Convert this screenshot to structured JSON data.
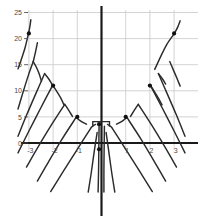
{
  "chart_data": {
    "type": "line",
    "title": "",
    "subtitle": "",
    "xlabel": "",
    "ylabel": "",
    "xlim": [
      -3.45,
      3.45
    ],
    "ylim": [
      -9.5,
      26.5
    ],
    "grid": true,
    "legend": false,
    "legend_position": "none",
    "colors": {
      "axis": "#1a1a1a",
      "grid": "#c8c8c8",
      "curve": "#2b2b2b",
      "marker": "#111111",
      "label": "#4a4a4a",
      "background": "#ffffff"
    },
    "x_ticks": [
      {
        "value": -3,
        "label": "-3"
      },
      {
        "value": -2,
        "label": "-2"
      },
      {
        "value": -1,
        "label": "-1"
      },
      {
        "value": 1,
        "label": "1"
      },
      {
        "value": 2,
        "label": "2"
      },
      {
        "value": 3,
        "label": "3"
      }
    ],
    "y_ticks": [
      {
        "value": 0,
        "label": "0"
      },
      {
        "value": 5,
        "label": "5"
      },
      {
        "value": 10,
        "label": "10"
      },
      {
        "value": 15,
        "label": "15"
      },
      {
        "value": 20,
        "label": "20"
      },
      {
        "value": 25,
        "label": "25"
      }
    ],
    "markers": [
      {
        "x": -3.0,
        "y": 21.0,
        "label": ""
      },
      {
        "x": -2.0,
        "y": 11.0,
        "label": ""
      },
      {
        "x": -1.0,
        "y": 5.0,
        "label": ""
      },
      {
        "x": -0.1,
        "y": 3.6,
        "label": ""
      },
      {
        "x": 1.0,
        "y": 5.0,
        "label": ""
      },
      {
        "x": 2.0,
        "y": 11.0,
        "label": ""
      },
      {
        "x": 3.0,
        "y": 21.0,
        "label": ""
      },
      {
        "x": -0.1,
        "y": -1.2,
        "label": ""
      }
    ],
    "series": [
      {
        "name": "upper-left-outer",
        "points": [
          [
            -3.45,
            14.2
          ],
          [
            -3.3,
            16.2
          ],
          [
            -3.15,
            18.4
          ],
          [
            -3.02,
            20.9
          ]
        ]
      },
      {
        "name": "upper-left-outer-tail",
        "points": [
          [
            -3.02,
            20.9
          ],
          [
            -2.96,
            22.3
          ],
          [
            -2.92,
            23.6
          ]
        ]
      },
      {
        "name": "upper-left-mid-rise",
        "points": [
          [
            -3.45,
            6.5
          ],
          [
            -3.25,
            9.6
          ],
          [
            -3.02,
            13.0
          ],
          [
            -2.82,
            15.6
          ]
        ]
      },
      {
        "name": "upper-left-mid-fall",
        "points": [
          [
            -2.82,
            15.6
          ],
          [
            -2.72,
            17.6
          ],
          [
            -2.65,
            19.2
          ]
        ]
      },
      {
        "name": "upper-left-mid-down",
        "points": [
          [
            -2.82,
            15.6
          ],
          [
            -2.7,
            14.6
          ],
          [
            -2.58,
            13.3
          ],
          [
            -2.48,
            11.8
          ]
        ]
      },
      {
        "name": "peak-a-rise",
        "points": [
          [
            -3.45,
            1.3
          ],
          [
            -3.1,
            5.3
          ],
          [
            -2.7,
            9.6
          ],
          [
            -2.35,
            13.3
          ]
        ]
      },
      {
        "name": "peak-a-fall",
        "points": [
          [
            -2.35,
            13.3
          ],
          [
            -2.2,
            12.4
          ],
          [
            -2.05,
            11.3
          ]
        ]
      },
      {
        "name": "peak-b-rise",
        "points": [
          [
            -3.45,
            -1.9
          ],
          [
            -3.0,
            2.3
          ],
          [
            -2.5,
            6.8
          ],
          [
            -2.02,
            11.05
          ]
        ]
      },
      {
        "name": "peak-b-fall",
        "points": [
          [
            -2.02,
            11.05
          ],
          [
            -1.85,
            9.9
          ],
          [
            -1.68,
            8.6
          ],
          [
            -1.55,
            7.3
          ]
        ]
      },
      {
        "name": "peak-c-rise",
        "points": [
          [
            -3.1,
            -4.6
          ],
          [
            -2.6,
            -0.6
          ],
          [
            -2.05,
            3.6
          ],
          [
            -1.52,
            7.4
          ]
        ]
      },
      {
        "name": "peak-c-fall",
        "points": [
          [
            -1.52,
            7.4
          ],
          [
            -1.4,
            6.6
          ],
          [
            -1.28,
            5.7
          ],
          [
            -1.2,
            5.1
          ]
        ]
      },
      {
        "name": "peak-d-rise",
        "points": [
          [
            -2.65,
            -7.3
          ],
          [
            -2.2,
            -3.7
          ],
          [
            -1.65,
            0.6
          ],
          [
            -1.05,
            4.9
          ]
        ]
      },
      {
        "name": "peak-d-fall",
        "points": [
          [
            -1.05,
            4.9
          ],
          [
            -0.9,
            4.35
          ],
          [
            -0.75,
            3.9
          ],
          [
            -0.62,
            3.6
          ]
        ]
      },
      {
        "name": "left-inner-rise",
        "points": [
          [
            -2.1,
            -9.3
          ],
          [
            -1.6,
            -5.6
          ],
          [
            -1.0,
            -1.2
          ],
          [
            -0.42,
            3.0
          ]
        ]
      },
      {
        "name": "left-inner-near-axis",
        "points": [
          [
            -0.42,
            3.0
          ],
          [
            -0.33,
            3.35
          ],
          [
            -0.25,
            3.55
          ]
        ]
      },
      {
        "name": "left-steep-tail",
        "points": [
          [
            -0.55,
            -9.4
          ],
          [
            -0.42,
            -5.6
          ],
          [
            -0.3,
            -1.6
          ],
          [
            -0.18,
            2.0
          ]
        ]
      },
      {
        "name": "center-left-vertical",
        "points": [
          [
            -0.14,
            -9.4
          ],
          [
            -0.12,
            -5.0
          ],
          [
            -0.11,
            -0.6
          ],
          [
            -0.1,
            3.2
          ]
        ]
      },
      {
        "name": "center-right-vertical",
        "points": [
          [
            0.1,
            -9.4
          ],
          [
            0.1,
            -5.0
          ],
          [
            0.11,
            -0.6
          ],
          [
            0.12,
            3.2
          ]
        ]
      },
      {
        "name": "right-steep-tail",
        "points": [
          [
            0.55,
            -9.4
          ],
          [
            0.42,
            -5.6
          ],
          [
            0.3,
            -1.6
          ],
          [
            0.19,
            2.0
          ]
        ]
      },
      {
        "name": "right-inner-rise",
        "points": [
          [
            2.1,
            -9.3
          ],
          [
            1.6,
            -5.6
          ],
          [
            1.0,
            -1.2
          ],
          [
            0.42,
            3.0
          ]
        ]
      },
      {
        "name": "right-inner-near-axis",
        "points": [
          [
            0.42,
            3.0
          ],
          [
            0.33,
            3.35
          ],
          [
            0.25,
            3.55
          ]
        ]
      },
      {
        "name": "peak-d-rise-r",
        "points": [
          [
            2.65,
            -7.3
          ],
          [
            2.2,
            -3.7
          ],
          [
            1.65,
            0.6
          ],
          [
            1.05,
            4.9
          ]
        ]
      },
      {
        "name": "peak-d-fall-r",
        "points": [
          [
            1.05,
            4.9
          ],
          [
            0.9,
            4.35
          ],
          [
            0.75,
            3.9
          ],
          [
            0.62,
            3.6
          ]
        ]
      },
      {
        "name": "peak-c-rise-r",
        "points": [
          [
            3.1,
            -4.6
          ],
          [
            2.6,
            -0.6
          ],
          [
            2.05,
            3.6
          ],
          [
            1.52,
            7.4
          ]
        ]
      },
      {
        "name": "peak-c-fall-r",
        "points": [
          [
            1.52,
            7.4
          ],
          [
            1.4,
            6.6
          ],
          [
            1.28,
            5.7
          ],
          [
            1.2,
            5.1
          ]
        ]
      },
      {
        "name": "peak-b-rise-r",
        "points": [
          [
            3.45,
            -1.9
          ],
          [
            3.0,
            2.3
          ],
          [
            2.5,
            6.8
          ],
          [
            2.02,
            11.05
          ]
        ]
      },
      {
        "name": "peak-b-fall-r",
        "points": [
          [
            2.02,
            11.05
          ],
          [
            2.18,
            9.9
          ],
          [
            2.35,
            8.6
          ],
          [
            2.5,
            7.3
          ]
        ]
      },
      {
        "name": "peak-a-rise-r",
        "points": [
          [
            3.45,
            1.3
          ],
          [
            3.1,
            5.3
          ],
          [
            2.7,
            9.6
          ],
          [
            2.35,
            13.3
          ]
        ]
      },
      {
        "name": "peak-a-fall-r",
        "points": [
          [
            2.35,
            13.3
          ],
          [
            2.5,
            12.4
          ],
          [
            2.65,
            11.3
          ]
        ]
      },
      {
        "name": "upper-right-mid-rise",
        "points": [
          [
            2.2,
            14.1
          ],
          [
            2.45,
            16.6
          ],
          [
            2.7,
            18.9
          ],
          [
            3.0,
            20.9
          ]
        ]
      },
      {
        "name": "upper-right-mid-fall",
        "points": [
          [
            2.82,
            15.6
          ],
          [
            2.95,
            14.2
          ],
          [
            3.1,
            12.6
          ],
          [
            3.25,
            10.9
          ]
        ]
      },
      {
        "name": "upper-right-outer",
        "points": [
          [
            3.0,
            20.9
          ],
          [
            3.15,
            22.2
          ],
          [
            3.25,
            23.4
          ]
        ]
      }
    ],
    "origin_bracket": {
      "x_left": -0.36,
      "x_right": 0.33,
      "y_top": 4.1,
      "y_bottom": 3.1
    }
  }
}
